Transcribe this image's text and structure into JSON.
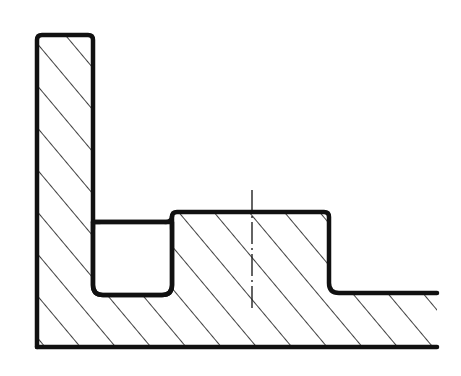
{
  "diagram": {
    "type": "mechanical-cross-section",
    "colors": {
      "background": "#ffffff",
      "outline": "#111111",
      "hatch": "#111111",
      "centerline": "#111111"
    },
    "features": [
      {
        "name": "vertical-wall",
        "label": ""
      },
      {
        "name": "pocket",
        "label": ""
      },
      {
        "name": "raised-boss",
        "label": ""
      },
      {
        "name": "base-flange",
        "label": ""
      },
      {
        "name": "centerline",
        "label": ""
      }
    ]
  }
}
